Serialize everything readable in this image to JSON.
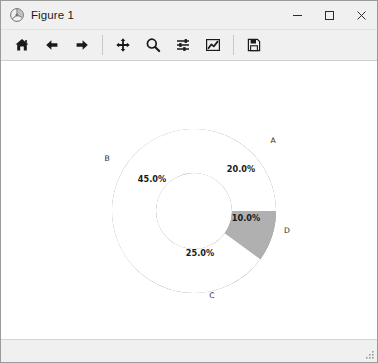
{
  "window": {
    "title": "Figure 1",
    "app_icon": "matplotlib-icon",
    "controls": {
      "minimize_label": "─",
      "maximize_label": "□",
      "close_label": "✕"
    }
  },
  "toolbar": {
    "buttons": [
      {
        "name": "home-button",
        "icon": "home-icon",
        "tooltip": "Reset original view"
      },
      {
        "name": "back-button",
        "icon": "arrow-left-icon",
        "tooltip": "Back to previous view"
      },
      {
        "name": "forward-button",
        "icon": "arrow-right-icon",
        "tooltip": "Forward to next view"
      },
      {
        "name": "pan-button",
        "icon": "move-cross-icon",
        "tooltip": "Pan axes with left mouse, zoom with right"
      },
      {
        "name": "zoom-button",
        "icon": "magnifier-icon",
        "tooltip": "Zoom to rectangle"
      },
      {
        "name": "configure-subplots-button",
        "icon": "sliders-icon",
        "tooltip": "Configure subplots"
      },
      {
        "name": "edit-axis-button",
        "icon": "line-chart-icon",
        "tooltip": "Edit axis, curve and image parameters"
      },
      {
        "name": "save-button",
        "icon": "floppy-disk-icon",
        "tooltip": "Save the figure"
      }
    ]
  },
  "statusbar": {
    "coords": ""
  },
  "chart_data": {
    "type": "pie",
    "variant": "donut",
    "title": "",
    "labels": [
      "A",
      "B",
      "C",
      "D"
    ],
    "values": [
      20.0,
      45.0,
      25.0,
      10.0
    ],
    "autopct": [
      "20.0%",
      "45.0%",
      "25.0%",
      "10.0%"
    ],
    "slice_colors": [
      "#b8b8b8",
      "#9d9d9d",
      "#b0b0b0",
      "#ffffff"
    ],
    "hidden_slices": [
      "D"
    ],
    "startangle": 72,
    "counterclock": false,
    "wedge_width": 0.54,
    "center": {
      "x": 193,
      "y": 208
    },
    "outer_radius": 82,
    "inner_radius": 38,
    "legend": "none",
    "grid": false,
    "slices": [
      {
        "label": "A",
        "value": 20.0,
        "pct": "20.0%",
        "color": "#b8b8b8",
        "start_deg": 72,
        "end_deg": 0,
        "pct_pos": {
          "x": 240,
          "y": 169
        },
        "label_pos": {
          "x": 272,
          "y": 140
        }
      },
      {
        "label": "B",
        "value": 45.0,
        "pct": "45.0%",
        "color": "#9d9d9d",
        "start_deg": 234,
        "end_deg": 72,
        "pct_pos": {
          "x": 151,
          "y": 179
        },
        "label_pos": {
          "x": 106,
          "y": 158
        }
      },
      {
        "label": "C",
        "value": 25.0,
        "pct": "25.0%",
        "color": "#b0b0b0",
        "start_deg": 324,
        "end_deg": 234,
        "pct_pos": {
          "x": 199,
          "y": 253
        },
        "label_pos": {
          "x": 211,
          "y": 295
        }
      },
      {
        "label": "D",
        "value": 10.0,
        "pct": "10.0%",
        "color": "#ffffff",
        "start_deg": 0,
        "end_deg": 324,
        "pct_pos": {
          "x": 245,
          "y": 218
        },
        "label_pos": {
          "x": 286,
          "y": 230
        }
      }
    ]
  },
  "colors": {
    "window_chrome": "#f0f0f0",
    "canvas_background": "#ffffff",
    "text": "#1a1a1a",
    "close_hover": "#e81123"
  }
}
